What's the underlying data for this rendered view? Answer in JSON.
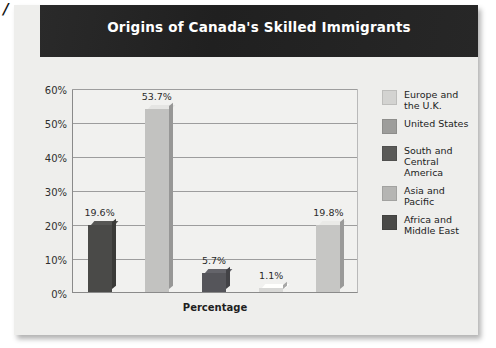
{
  "scan_artifact": "/",
  "header": {
    "title": "Origins of Canada's Skilled Immigrants"
  },
  "axes": {
    "xlabel": "Percentage",
    "yticks": [
      "60%",
      "50%",
      "40%",
      "30%",
      "20%",
      "10%",
      "0%"
    ]
  },
  "legend": {
    "items": [
      {
        "label": "Europe and\nthe U.K.",
        "color": "#d3d3d1"
      },
      {
        "label": "United States",
        "color": "#9d9d9b"
      },
      {
        "label": "South and\nCentral America",
        "color": "#5a5a58"
      },
      {
        "label": "Asia and\nPacific",
        "color": "#b5b5b3"
      },
      {
        "label": "Africa and\nMiddle East",
        "color": "#4a4a48"
      }
    ]
  },
  "chart_data": {
    "type": "bar",
    "title": "Origins of Canada's Skilled Immigrants",
    "xlabel": "Percentage",
    "ylabel": "",
    "ylim": [
      0,
      60
    ],
    "ytick_values": [
      0,
      10,
      20,
      30,
      40,
      50,
      60
    ],
    "grid": true,
    "legend_position": "right",
    "categories": [
      "Africa and Middle East",
      "Asia and Pacific",
      "South and Central America",
      "United States",
      "Europe and the U.K."
    ],
    "values": [
      19.6,
      53.7,
      5.7,
      1.1,
      19.8
    ],
    "data_labels": [
      "19.6%",
      "53.7%",
      "5.7%",
      "1.1%",
      "19.8%"
    ],
    "bar_colors": [
      "#4a4a48",
      "#c2c2c0",
      "#55555a",
      "#d8d8d6",
      "#c6c6c4"
    ]
  }
}
